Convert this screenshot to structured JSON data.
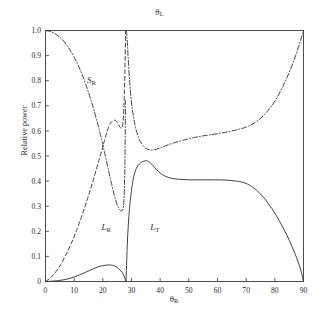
{
  "chart": {
    "title": "θL",
    "title_base": "θ",
    "title_sub": "L",
    "xlabel_base": "θ",
    "xlabel_sub": "R",
    "ylabel": "Relative power"
  },
  "chart_data": {
    "type": "line",
    "xlabel": "θ_R",
    "ylabel": "Relative power",
    "xlim": [
      0,
      90
    ],
    "ylim": [
      0,
      1.0
    ],
    "xticks": [
      0,
      10,
      20,
      30,
      40,
      50,
      60,
      70,
      80,
      90
    ],
    "yticks": [
      0,
      0.1,
      0.2,
      0.3,
      0.4,
      0.5,
      0.6,
      0.7,
      0.8,
      0.9,
      1.0
    ],
    "xtick_labels": [
      "0",
      "10",
      "20",
      "30",
      "40",
      "50",
      "60",
      "70",
      "80",
      "90"
    ],
    "ytick_labels": [
      "0",
      "0.1",
      "0.2",
      "0.3",
      "0.4",
      "0.5",
      "0.6",
      "0.7",
      "0.8",
      "0.9",
      "1.0"
    ],
    "grid": false,
    "legend": "inline-annotations",
    "annotations": [
      {
        "text": "S_R",
        "base": "S",
        "sub": "R",
        "x": 14.5,
        "y": 0.79
      },
      {
        "text": "L_R",
        "base": "L",
        "sub": "R",
        "x": 19.5,
        "y": 0.205
      },
      {
        "text": "L_T",
        "base": "L",
        "sub": "T",
        "x": 36.5,
        "y": 0.205
      }
    ],
    "series": [
      {
        "name": "S_R",
        "style": "dash-dot",
        "color": "#3a3a3a",
        "segments": [
          {
            "x": [
              0,
              2,
              4,
              6,
              8,
              10,
              12,
              14,
              16,
              18,
              20,
              21,
              22,
              23,
              24,
              25,
              25.8,
              26.4,
              27,
              27.4,
              27.7,
              27.9
            ],
            "y": [
              1.0,
              0.995,
              0.982,
              0.962,
              0.932,
              0.894,
              0.846,
              0.787,
              0.718,
              0.637,
              0.545,
              0.494,
              0.442,
              0.391,
              0.344,
              0.306,
              0.288,
              0.281,
              0.288,
              0.33,
              0.47,
              0.72
            ]
          },
          {
            "x": [
              28.15,
              28.4,
              28.8,
              29.4,
              30.2,
              31.2,
              32.4,
              33.6,
              35,
              36.5,
              38,
              40,
              42,
              45,
              48,
              52,
              56,
              60,
              64,
              68,
              71,
              74,
              77,
              80,
              83,
              85.5,
              87.5,
              89,
              90
            ],
            "y": [
              1.0,
              0.98,
              0.9,
              0.79,
              0.695,
              0.625,
              0.575,
              0.548,
              0.531,
              0.524,
              0.525,
              0.532,
              0.541,
              0.553,
              0.563,
              0.574,
              0.582,
              0.589,
              0.597,
              0.608,
              0.62,
              0.641,
              0.673,
              0.718,
              0.782,
              0.846,
              0.908,
              0.962,
              1.0
            ]
          }
        ]
      },
      {
        "name": "L_R",
        "style": "dashed",
        "color": "#3a3a3a",
        "segments": [
          {
            "x": [
              0,
              1.5,
              3,
              5,
              7,
              9,
              11,
              13,
              15,
              17,
              19,
              20.5,
              22,
              23,
              24,
              24.8,
              25.5,
              26.2,
              26.8,
              27.2,
              27.55,
              27.8,
              27.95
            ],
            "y": [
              0.0,
              0.012,
              0.03,
              0.062,
              0.103,
              0.152,
              0.209,
              0.272,
              0.342,
              0.417,
              0.497,
              0.558,
              0.614,
              0.635,
              0.643,
              0.638,
              0.624,
              0.612,
              0.617,
              0.66,
              0.76,
              0.9,
              1.0
            ]
          }
        ]
      },
      {
        "name": "L_T",
        "style": "solid",
        "color": "#3a3a3a",
        "segments": [
          {
            "x": [
              0,
              2,
              4,
              6,
              8,
              10,
              12,
              14,
              16,
              18,
              20,
              22,
              23,
              24,
              25,
              26,
              26.8,
              27.4,
              27.8,
              28.05
            ],
            "y": [
              0.0,
              0.001,
              0.003,
              0.006,
              0.011,
              0.018,
              0.027,
              0.037,
              0.047,
              0.057,
              0.063,
              0.066,
              0.065,
              0.062,
              0.056,
              0.046,
              0.035,
              0.022,
              0.009,
              0.0
            ]
          },
          {
            "x": [
              28.1,
              28.5,
              29,
              29.6,
              30.4,
              31.2,
              32.2,
              33.2,
              34.2,
              35.2,
              36,
              37,
              38,
              39.5,
              41,
              43,
              45,
              48,
              51,
              55,
              59,
              63,
              66,
              68.5,
              70.5,
              72.5,
              74.5,
              76.5,
              79,
              81.5,
              84,
              86,
              87.5,
              88.5,
              89.3,
              90
            ],
            "y": [
              0.0,
              0.14,
              0.245,
              0.325,
              0.395,
              0.436,
              0.461,
              0.473,
              0.479,
              0.481,
              0.478,
              0.468,
              0.455,
              0.437,
              0.424,
              0.414,
              0.409,
              0.406,
              0.405,
              0.405,
              0.405,
              0.404,
              0.401,
              0.396,
              0.388,
              0.374,
              0.354,
              0.329,
              0.29,
              0.243,
              0.189,
              0.139,
              0.097,
              0.066,
              0.035,
              0.0
            ]
          }
        ]
      }
    ]
  }
}
